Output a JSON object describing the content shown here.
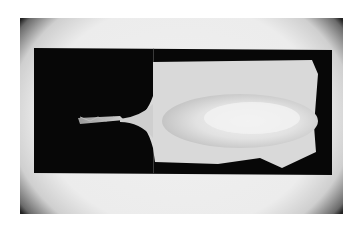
{
  "image": {
    "description": "Grayscale shadowgraph of a liquid jet emerging from a nozzle and expanding into a spray plume inside a rectangular dark window, with circular vignetting at the frame corners",
    "colors": {
      "background": "#ffffff",
      "field": "#ececec",
      "window": "#070707",
      "plume": "#d8d8d8",
      "plume_core": "#ededed",
      "vignette": "#222222"
    }
  }
}
